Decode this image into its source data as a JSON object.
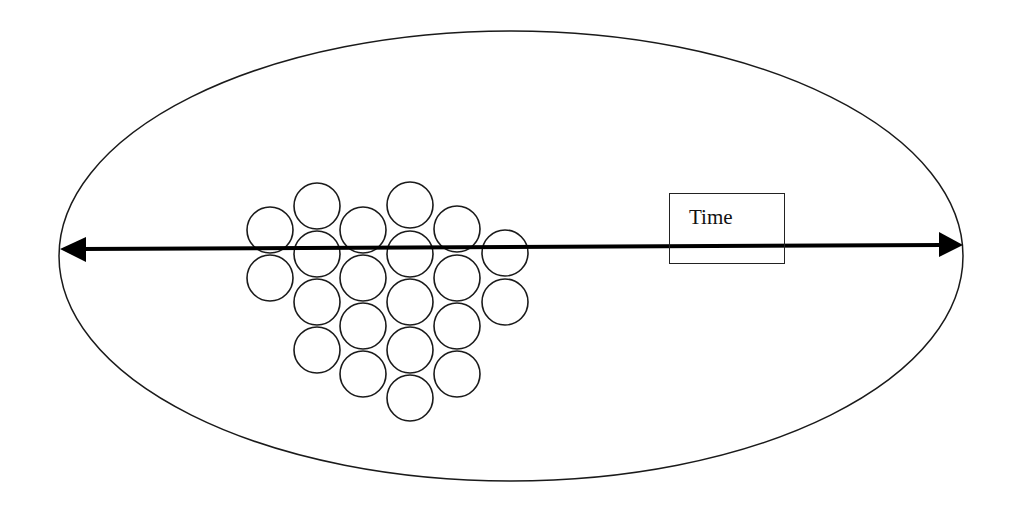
{
  "diagram": {
    "type": "conceptual",
    "colors": {
      "background": "#ffffff",
      "stroke": "#1a1a1a"
    },
    "container": {
      "shape": "ellipse",
      "cx": 511,
      "cy": 256,
      "rx": 452,
      "ry": 225
    },
    "axis": {
      "label": "Time",
      "arrow": "double-headed",
      "x1": 60,
      "y1": 249,
      "x2": 963,
      "y2": 245
    },
    "label_box": {
      "text": "Time",
      "x": 669,
      "y": 193,
      "width": 116,
      "height": 71
    },
    "circle_radius": 23,
    "circles": [
      {
        "cx": 270,
        "cy": 230
      },
      {
        "cx": 270,
        "cy": 278
      },
      {
        "cx": 317,
        "cy": 206
      },
      {
        "cx": 317,
        "cy": 254
      },
      {
        "cx": 317,
        "cy": 302
      },
      {
        "cx": 317,
        "cy": 350
      },
      {
        "cx": 363,
        "cy": 230
      },
      {
        "cx": 363,
        "cy": 278
      },
      {
        "cx": 363,
        "cy": 326
      },
      {
        "cx": 363,
        "cy": 374
      },
      {
        "cx": 410,
        "cy": 205
      },
      {
        "cx": 410,
        "cy": 254
      },
      {
        "cx": 410,
        "cy": 302
      },
      {
        "cx": 410,
        "cy": 350
      },
      {
        "cx": 410,
        "cy": 398
      },
      {
        "cx": 457,
        "cy": 229
      },
      {
        "cx": 457,
        "cy": 278
      },
      {
        "cx": 457,
        "cy": 326
      },
      {
        "cx": 457,
        "cy": 374
      },
      {
        "cx": 505,
        "cy": 253
      },
      {
        "cx": 505,
        "cy": 302
      }
    ],
    "circle_count": 21
  }
}
